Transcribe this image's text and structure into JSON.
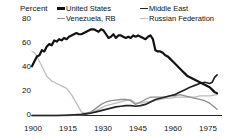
{
  "chart_data": {
    "type": "line",
    "title": "",
    "subtitle": "",
    "xlabel": "",
    "ylabel": "Percent",
    "ylim": [
      0,
      80
    ],
    "xlim": [
      1900,
      1977
    ],
    "yticks": [
      0,
      20,
      40,
      60,
      80
    ],
    "xticks": [
      1900,
      1915,
      1930,
      1945,
      1960,
      1975
    ],
    "grid": false,
    "legend_position": "top",
    "colors": {
      "united_states": "#121212",
      "middle_east": "#232323",
      "venezuela_rb": "#8d8d8d",
      "russian_federation": "#bdbdbd",
      "axis": "#222222",
      "text": "#111111",
      "background": "#ffffff"
    },
    "series": [
      {
        "name": "United States",
        "color": "#121212",
        "x": [
          1900,
          1901,
          1902,
          1903,
          1904,
          1905,
          1906,
          1907,
          1908,
          1909,
          1910,
          1911,
          1912,
          1913,
          1914,
          1915,
          1916,
          1917,
          1918,
          1919,
          1920,
          1921,
          1922,
          1923,
          1924,
          1925,
          1926,
          1927,
          1928,
          1929,
          1930,
          1931,
          1932,
          1933,
          1934,
          1935,
          1936,
          1937,
          1938,
          1939,
          1940,
          1941,
          1942,
          1943,
          1944,
          1945,
          1946,
          1947,
          1948,
          1949,
          1950,
          1951,
          1952,
          1953,
          1954,
          1955,
          1956,
          1957,
          1958,
          1959,
          1960,
          1961,
          1962,
          1963,
          1964,
          1965,
          1966,
          1967,
          1968,
          1969,
          1970,
          1971,
          1972,
          1973,
          1974,
          1975
        ],
        "values": [
          40,
          44,
          48,
          49,
          53,
          52,
          56,
          58,
          57,
          61,
          60,
          62,
          61,
          63,
          62,
          64,
          65,
          66,
          67,
          66,
          66,
          67,
          68,
          69,
          70,
          70,
          69,
          68,
          70,
          69,
          66,
          63,
          64,
          66,
          63,
          65,
          65,
          64,
          63,
          64,
          63,
          65,
          64,
          65,
          64,
          63,
          62,
          64,
          65,
          62,
          53,
          52,
          52,
          51,
          49,
          48,
          46,
          44,
          42,
          40,
          38,
          36,
          34,
          32,
          31,
          30,
          29,
          28,
          27,
          26,
          25,
          24,
          23,
          21,
          19,
          18
        ]
      },
      {
        "name": "Middle East",
        "color": "#232323",
        "x": [
          1900,
          1905,
          1910,
          1913,
          1915,
          1918,
          1920,
          1922,
          1924,
          1926,
          1928,
          1930,
          1932,
          1934,
          1936,
          1938,
          1940,
          1942,
          1944,
          1946,
          1948,
          1950,
          1952,
          1954,
          1956,
          1958,
          1960,
          1962,
          1964,
          1966,
          1968,
          1970,
          1972,
          1973,
          1974,
          1975
        ],
        "values": [
          0,
          0,
          0,
          0.2,
          0.4,
          0.7,
          1,
          1.5,
          2,
          3,
          4,
          5,
          6,
          7,
          7.5,
          8,
          8,
          7.5,
          8,
          9,
          11,
          13,
          14,
          15,
          16,
          17,
          19,
          21,
          23,
          24.5,
          26,
          27,
          26,
          27,
          31,
          33
        ]
      },
      {
        "name": "Venezuela, RB",
        "color": "#8d8d8d",
        "x": [
          1900,
          1910,
          1915,
          1918,
          1920,
          1922,
          1924,
          1926,
          1928,
          1930,
          1932,
          1934,
          1936,
          1938,
          1940,
          1942,
          1944,
          1946,
          1948,
          1950,
          1952,
          1954,
          1956,
          1958,
          1960,
          1962,
          1964,
          1966,
          1968,
          1970,
          1972,
          1975
        ],
        "values": [
          0,
          0,
          0,
          0.3,
          0.6,
          1,
          3,
          6,
          9,
          11,
          12,
          12.5,
          13,
          13,
          12,
          9,
          11,
          13,
          15,
          15,
          15,
          15,
          16,
          16,
          17,
          16,
          15,
          14,
          13,
          12,
          10,
          5
        ]
      },
      {
        "name": "Russian Federation",
        "color": "#bdbdbd",
        "x": [
          1900,
          1901,
          1902,
          1903,
          1904,
          1905,
          1906,
          1908,
          1910,
          1912,
          1914,
          1916,
          1918,
          1920,
          1921,
          1922,
          1924,
          1926,
          1928,
          1930,
          1932,
          1934,
          1936,
          1938,
          1940,
          1942,
          1944,
          1946,
          1948,
          1950,
          1952,
          1954,
          1956,
          1958,
          1960,
          1962,
          1964,
          1966,
          1968,
          1970,
          1972,
          1975
        ],
        "values": [
          52,
          51,
          48,
          44,
          40,
          36,
          32,
          28,
          26,
          24,
          22,
          17,
          10,
          3,
          2,
          2,
          3,
          4,
          6,
          8,
          9,
          10,
          11,
          12,
          13,
          10,
          10,
          11,
          11,
          12,
          13,
          14,
          14,
          15,
          15,
          15,
          15,
          15,
          16,
          16,
          16,
          17
        ]
      }
    ]
  },
  "axes": {
    "y_title": "Percent",
    "y_ticks": [
      "80",
      "60",
      "40",
      "20",
      "0"
    ],
    "x_ticks": [
      "1900",
      "1915",
      "1930",
      "1945",
      "1960",
      "1975"
    ]
  },
  "legend": {
    "items": [
      {
        "label": "United States",
        "swatch": "line-swatch-dark"
      },
      {
        "label": "Middle East",
        "swatch": "line-swatch-dark"
      },
      {
        "label": "Venezuela, RB",
        "swatch": "line-swatch-gray"
      },
      {
        "label": "Russian Federation",
        "swatch": "line-swatch-lightgray"
      }
    ]
  }
}
